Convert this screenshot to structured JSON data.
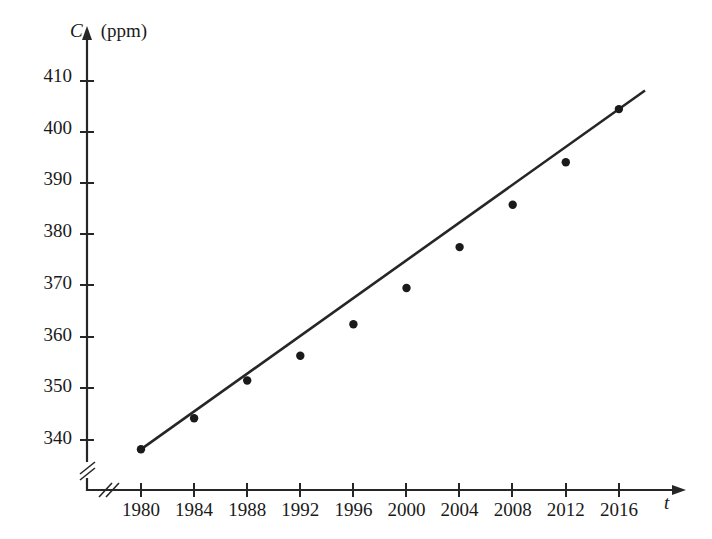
{
  "chart_data": {
    "type": "scatter",
    "title": "",
    "xlabel": "t",
    "ylabel": "C",
    "y_unit": "(ppm)",
    "x": [
      1980,
      1984,
      1988,
      1992,
      1996,
      2000,
      2004,
      2008,
      2012,
      2016
    ],
    "values": [
      338.2,
      344.2,
      351.5,
      356.3,
      362.4,
      369.4,
      377.3,
      385.5,
      393.7,
      404.0
    ],
    "xticks": [
      "1980",
      "1984",
      "1988",
      "1992",
      "1996",
      "2000",
      "2004",
      "2008",
      "2012",
      "2016"
    ],
    "yticks": [
      "340",
      "350",
      "360",
      "370",
      "380",
      "390",
      "400",
      "410"
    ],
    "xlim": [
      1980,
      2016
    ],
    "ylim": [
      335,
      412
    ],
    "grid": false,
    "legend": null,
    "axis_break_x": true,
    "axis_break_y": true,
    "series": [
      {
        "name": "CO2 concentration",
        "type": "scatter",
        "marker": "filled-circle",
        "color": "#1a1a1a",
        "points": [
          {
            "x": 1980,
            "y": 338.2
          },
          {
            "x": 1984,
            "y": 344.2
          },
          {
            "x": 1988,
            "y": 351.5
          },
          {
            "x": 1992,
            "y": 356.3
          },
          {
            "x": 1996,
            "y": 362.4
          },
          {
            "x": 2000,
            "y": 369.4
          },
          {
            "x": 2004,
            "y": 377.3
          },
          {
            "x": 2008,
            "y": 385.5
          },
          {
            "x": 2012,
            "y": 393.7
          },
          {
            "x": 2016,
            "y": 404.0
          }
        ]
      },
      {
        "name": "regression line",
        "type": "line",
        "color": "#262626",
        "endpoints": [
          {
            "x": 1980,
            "y": 338.2
          },
          {
            "x": 2016,
            "y": 404.0
          }
        ]
      }
    ]
  },
  "axes": {
    "y_title_var": "C",
    "y_title_unit": "(ppm)",
    "x_title_var": "t"
  }
}
